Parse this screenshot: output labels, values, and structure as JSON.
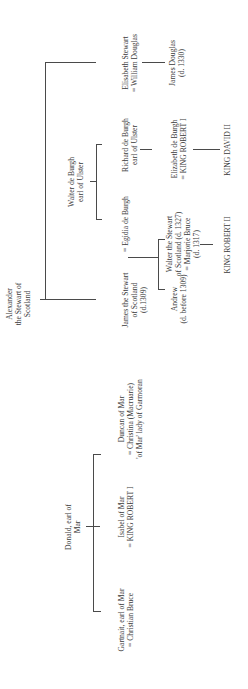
{
  "diagram": {
    "type": "family-tree",
    "orientation": "rotated-90-ccw",
    "nodes": {
      "alexander": "Alexander\nthe Stewart of\nScotland",
      "walter_de_burgh": "Walter de Burgh\nearl of Ulster",
      "donald": "Donald, earl of\nMar",
      "james_stewart": "James the Stewart\nof Scotland\n(d.1309)",
      "egidia": "= Egidia de Burgh",
      "richard": "Richard de Burgh\nearl of Ulster",
      "elisabeth_stewart": "Elisabeth Stewart\n= William Douglas",
      "andrew": "Andrew\n(d. before 1309)",
      "walter_stewart": "Walter the Stewart\nof Scotland (d. 1327)\n= Marjorie Bruce\n(d. 1317)",
      "elizabeth_de_burgh": "Elizabeth de Burgh\n= KING ROBERT I",
      "james_douglas": "James Douglas\n(d. 1330)",
      "king_robert_ii": "KING ROBERT II",
      "king_david_ii": "KING DAVID II",
      "gartnait": "Gartnait, earl of Mar\n= Christian Bruce",
      "isabel": "Isabel of Mar\n= KING ROBERT I",
      "duncan": "Duncan of Mar\n= Christina (Macruarie)\n'of Mar' lady of Garmoran"
    }
  }
}
